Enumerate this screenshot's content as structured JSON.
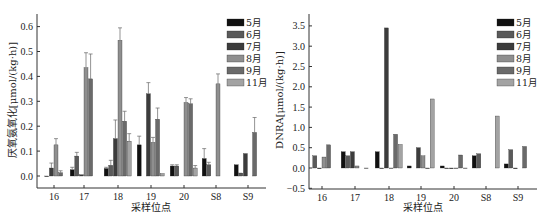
{
  "chart_data": [
    {
      "type": "bar",
      "title": "",
      "xlabel": "采样位点",
      "ylabel": "厌氧氨氧化[μmol/(kg·h)]",
      "categories": [
        "16",
        "17",
        "18",
        "19",
        "20",
        "S8",
        "S9"
      ],
      "ylim": [
        -0.05,
        0.65
      ],
      "yticks": [
        "0.0",
        "0.1",
        "0.2",
        "0.3",
        "0.4",
        "0.5",
        "0.6"
      ],
      "grid": false,
      "legend_position": "upper right",
      "error_bars": true,
      "series": [
        {
          "name": "5月",
          "color": "#111111",
          "values": [
            null,
            0.025,
            0.03,
            0.125,
            0.04,
            0.07,
            0.045
          ],
          "errors": [
            null,
            0.01,
            0.005,
            0.035,
            0.005,
            0.04,
            0.0
          ]
        },
        {
          "name": "6月",
          "color": "#5a5a5a",
          "values": [
            0.0,
            0.08,
            0.043,
            null,
            0.04,
            0.045,
            0.012
          ],
          "errors": [
            0.0,
            0.015,
            0.02,
            null,
            0.005,
            0.01,
            0.0
          ]
        },
        {
          "name": "7月",
          "color": "#3c3c3c",
          "values": [
            0.032,
            0.005,
            0.15,
            0.33,
            null,
            null,
            0.09
          ],
          "errors": [
            0.02,
            0.0,
            0.075,
            0.045,
            null,
            null,
            0.0
          ]
        },
        {
          "name": "8月",
          "color": "#8f8f8f",
          "values": [
            0.125,
            0.435,
            0.545,
            0.135,
            0.295,
            0.37,
            null
          ],
          "errors": [
            0.025,
            0.06,
            0.05,
            0.02,
            0.02,
            0.04,
            null
          ]
        },
        {
          "name": "9月",
          "color": "#6a6a6a",
          "values": [
            0.013,
            0.39,
            0.22,
            0.228,
            0.29,
            null,
            0.175
          ],
          "errors": [
            0.008,
            0.1,
            0.04,
            0.045,
            0.02,
            null,
            0.06
          ]
        },
        {
          "name": "11月",
          "color": "#a3a3a3",
          "values": [
            null,
            null,
            0.14,
            0.01,
            0.032,
            null,
            null
          ],
          "errors": [
            null,
            null,
            0.03,
            0.0,
            0.01,
            null,
            null
          ]
        }
      ]
    },
    {
      "type": "bar",
      "title": "",
      "xlabel": "采样位点",
      "ylabel": "DNRA[μmol/(kg·h)]",
      "categories": [
        "16",
        "17",
        "18",
        "19",
        "20",
        "S8",
        "S9"
      ],
      "ylim": [
        -0.5,
        3.7
      ],
      "yticks": [
        "-0.5",
        "0.0",
        "0.5",
        "1.0",
        "1.5",
        "2.0",
        "2.5",
        "3.0",
        "3.5"
      ],
      "grid": false,
      "legend_position": "upper right",
      "error_bars": true,
      "series": [
        {
          "name": "5月",
          "color": "#111111",
          "values": [
            null,
            0.4,
            0.4,
            0.05,
            0.05,
            0.3,
            0.1
          ]
        },
        {
          "name": "6月",
          "color": "#5a5a5a",
          "values": [
            0.3,
            0.3,
            0.0,
            null,
            0.0,
            0.35,
            0.45
          ]
        },
        {
          "name": "7月",
          "color": "#3c3c3c",
          "values": [
            0.0,
            0.4,
            3.45,
            0.5,
            0.0,
            null,
            0.0
          ]
        },
        {
          "name": "8月",
          "color": "#8f8f8f",
          "values": [
            0.27,
            0.05,
            0.0,
            0.3,
            0.0,
            null,
            null
          ]
        },
        {
          "name": "9月",
          "color": "#6a6a6a",
          "values": [
            0.57,
            null,
            0.83,
            0.0,
            0.32,
            null,
            0.53
          ]
        },
        {
          "name": "11月",
          "color": "#a3a3a3",
          "values": [
            null,
            0.0,
            0.58,
            1.7,
            0.0,
            1.28,
            null
          ]
        }
      ]
    }
  ],
  "left_chart": {
    "ylabel": "厌氧氨氧化[μmol/(kg·h)]",
    "xlabel": "采样位点",
    "yticks": [
      "0.0",
      "0.1",
      "0.2",
      "0.3",
      "0.4",
      "0.5",
      "0.6"
    ],
    "categories": [
      "16",
      "17",
      "18",
      "19",
      "20",
      "S8",
      "S9"
    ],
    "legend": [
      "5月",
      "6月",
      "7月",
      "8月",
      "9月",
      "11月"
    ]
  },
  "right_chart": {
    "ylabel": "DNRA[μmol/(kg·h)]",
    "xlabel": "采样位点",
    "yticks": [
      "-0.5",
      "0.0",
      "0.5",
      "1.0",
      "1.5",
      "2.0",
      "2.5",
      "3.0",
      "3.5"
    ],
    "categories": [
      "16",
      "17",
      "18",
      "19",
      "20",
      "S8",
      "S9"
    ],
    "legend": [
      "5月",
      "6月",
      "7月",
      "8月",
      "9月",
      "11月"
    ]
  }
}
